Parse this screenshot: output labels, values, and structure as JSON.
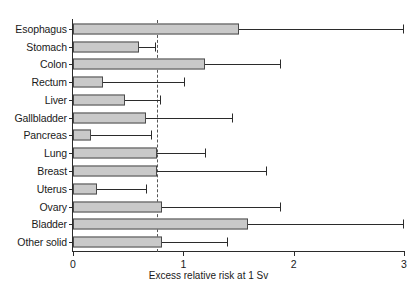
{
  "chart_data": {
    "type": "bar",
    "orientation": "horizontal",
    "title": "",
    "xlabel": "Excess relative risk at 1 Sv",
    "ylabel": "",
    "xlim": [
      0,
      3
    ],
    "xticks": [
      0,
      1,
      2,
      3
    ],
    "xtick_labels": [
      "0",
      "1",
      "2",
      "3"
    ],
    "grid": false,
    "legend": false,
    "reference_line": {
      "value": 0.76,
      "style": "dashed",
      "orientation": "vertical"
    },
    "categories": [
      "Esophagus",
      "Stomach",
      "Colon",
      "Rectum",
      "Liver",
      "Gallbladder",
      "Pancreas",
      "Lung",
      "Breast",
      "Uterus",
      "Ovary",
      "Bladder",
      "Other solid"
    ],
    "values": [
      1.5,
      0.6,
      1.2,
      0.27,
      0.47,
      0.66,
      0.16,
      0.76,
      0.76,
      0.22,
      0.81,
      1.59,
      0.81
    ],
    "error_upper": [
      3.0,
      0.74,
      1.88,
      1.01,
      0.79,
      1.44,
      0.71,
      1.2,
      1.75,
      0.66,
      1.88,
      3.0,
      1.4
    ],
    "bar_color": "#c9c9c9",
    "bar_edge_color": "#4a4a4a",
    "error_color": "#2b2b2b"
  }
}
